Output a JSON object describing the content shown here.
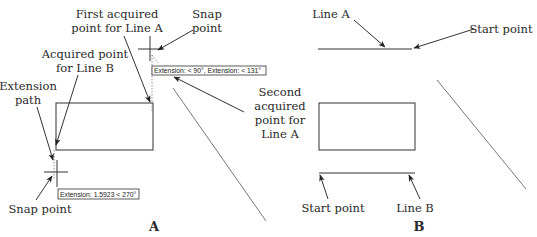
{
  "panel_a": {
    "caption": "A",
    "labels": {
      "first_acquired_l1": "First acquired",
      "first_acquired_l2": "point for Line A",
      "snap_top_l1": "Snap",
      "snap_top_l2": "point",
      "acquired_b_l1": "Acquired point",
      "acquired_b_l2": "for Line B",
      "extension_l1": "Extension",
      "extension_l2": "path",
      "second_l1": "Second",
      "second_l2": "acquired",
      "second_l3": "point for",
      "second_l4": "Line A",
      "snap_bottom": "Snap point"
    },
    "tooltips": {
      "top": "Extension: < 90°,  Extension: < 131°",
      "bottom": "Extension: 1.5923 < 270°"
    }
  },
  "panel_b": {
    "caption": "B",
    "labels": {
      "line_a": "Line A",
      "start_top": "Start point",
      "start_bottom": "Start point",
      "line_b": "Line B"
    }
  }
}
